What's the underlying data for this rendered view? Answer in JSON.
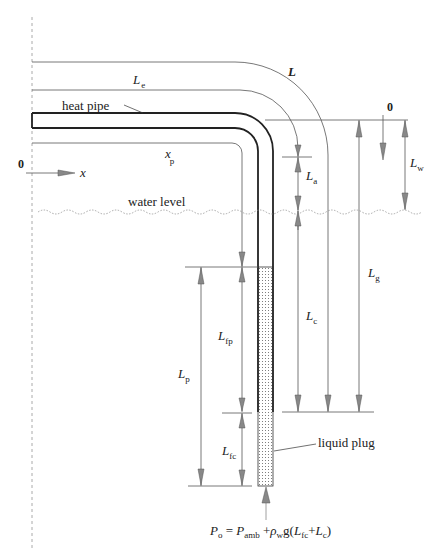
{
  "diagram": {
    "labels": {
      "L": "L",
      "L_main": "L",
      "Le_main": "L",
      "Le_sub": "e",
      "heat_pipe": "heat pipe",
      "xp_main": "x",
      "xp_sub": "p",
      "zero_x": "0",
      "x_axis": "x",
      "zero_z": "0",
      "Lw_main": "L",
      "Lw_sub": "w",
      "La_main": "L",
      "La_sub": "a",
      "water_level": "water level",
      "Lg_main": "L",
      "Lg_sub": "g",
      "Lc_main": "L",
      "Lc_sub": "c",
      "Lfp_main": "L",
      "Lfp_sub": "fp",
      "Lp_main": "L",
      "Lp_sub": "p",
      "Lfc_main": "L",
      "Lfc_sub": "fc",
      "liquid_plug": "liquid plug"
    },
    "equation": {
      "P": "P",
      "o": "o",
      "eq": " = ",
      "P2": "P",
      "amb": "amb",
      "plus": " +",
      "rho": "ρ",
      "w": "w",
      "g": "g(",
      "L1": "L",
      "fc": "fc",
      "plus2": "+",
      "L2": "L",
      "c": "c",
      "close": ")"
    },
    "colors": {
      "line": "#333333",
      "thin": "#555555",
      "arrow": "#8a8a8a",
      "dash": "#aaaaaa"
    }
  }
}
